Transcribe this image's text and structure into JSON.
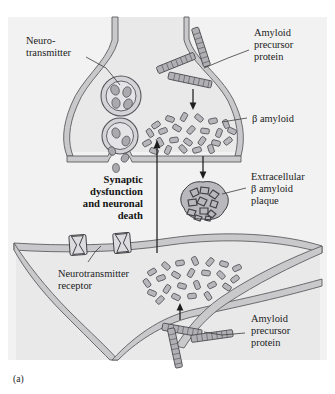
{
  "figure": {
    "caption": "(a)",
    "panel_bg": "#f2f2f2",
    "ink": "#1d1d1d"
  },
  "labels": {
    "neurotransmitter": {
      "line1": "Neuro-",
      "line2": "transmitter"
    },
    "amyloid_precursor_protein_top": {
      "line1": "Amyloid",
      "line2": "precursor",
      "line3": "protein"
    },
    "beta_amyloid": "β amyloid",
    "extracellular_plaque": {
      "line1": "Extracellular",
      "line2": "β amyloid",
      "line3": "plaque"
    },
    "synaptic_dysfunction": {
      "line1": "Synaptic",
      "line2": "dysfunction",
      "line3": "and neuronal",
      "line4": "death"
    },
    "neurotransmitter_receptor": {
      "line1": "Neurotransmitter",
      "line2": "receptor"
    },
    "amyloid_precursor_protein_bottom": {
      "line1": "Amyloid",
      "line2": "precursor",
      "line3": "protein"
    }
  },
  "colors": {
    "membrane": "#c9c9cc",
    "membrane_stroke": "#5d5d61",
    "cytoplasm": "#e9e9ea",
    "amyloid_fill": "#b6b6bb",
    "plaque_fill": "#b8b8bd",
    "leader": "#3c3c3c"
  }
}
